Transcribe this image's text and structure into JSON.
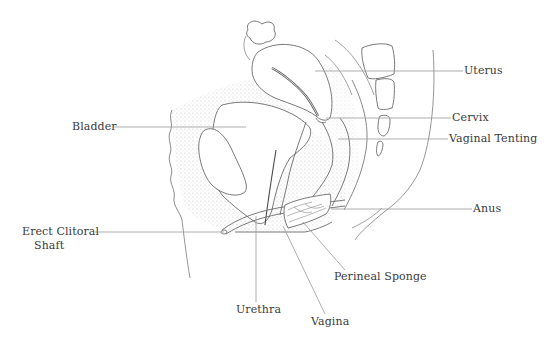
{
  "diagram": {
    "type": "anatomical-sagittal-section",
    "colors": {
      "background": "#ffffff",
      "line": "#6a6a6a",
      "leader": "#9a9a9a",
      "stipple": "#d8d8d8",
      "text": "#3a3a3a"
    },
    "labels": {
      "uterus": "Uterus",
      "bladder": "Bladder",
      "cervix": "Cervix",
      "vaginal_tenting": "Vaginal Tenting",
      "anus": "Anus",
      "erect_clitoral_shaft_line1": "Erect Clitoral",
      "erect_clitoral_shaft_line2": "Shaft",
      "perineal_sponge": "Perineal Sponge",
      "urethra": "Urethra",
      "vagina": "Vagina"
    }
  }
}
